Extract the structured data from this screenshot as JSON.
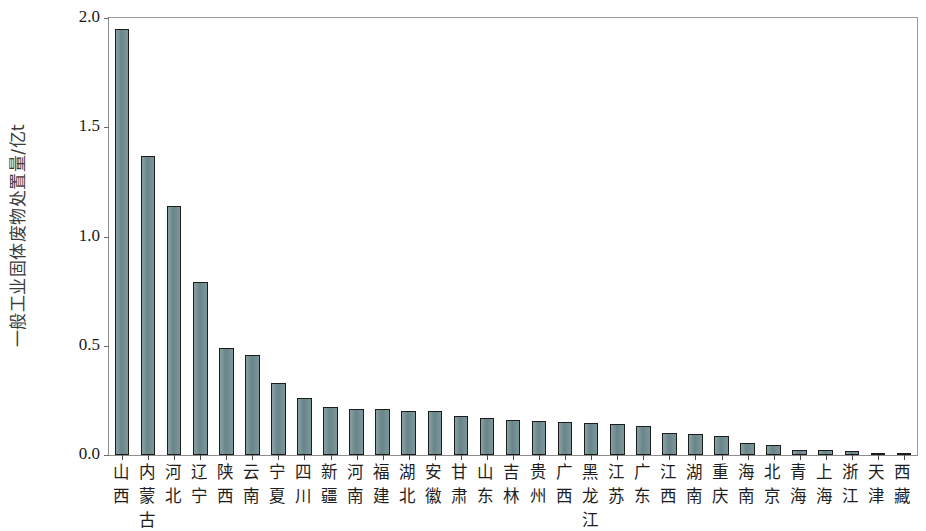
{
  "chart_data": {
    "type": "bar",
    "title": "",
    "xlabel": "",
    "ylabel": "一般工业固体废物处置量/亿t",
    "ylim": [
      0.0,
      2.0
    ],
    "ytick_labels": [
      "0.0",
      "0.5",
      "1.0",
      "1.5",
      "2.0"
    ],
    "ytick_values": [
      0.0,
      0.5,
      1.0,
      1.5,
      2.0
    ],
    "grid": false,
    "legend": null,
    "bar_color": "#6e8c90",
    "bar_edge_color": "#1c1c1c",
    "categories": [
      "山西",
      "内蒙古",
      "河北",
      "辽宁",
      "陕西",
      "云南",
      "宁夏",
      "四川",
      "新疆",
      "河南",
      "福建",
      "湖北",
      "安徽",
      "甘肃",
      "山东",
      "吉林",
      "贵州",
      "广西",
      "黑龙江",
      "江苏",
      "广东",
      "江西",
      "湖南",
      "重庆",
      "海南",
      "北京",
      "青海",
      "上海",
      "浙江",
      "天津",
      "西藏"
    ],
    "values": [
      1.95,
      1.37,
      1.14,
      0.79,
      0.49,
      0.46,
      0.33,
      0.26,
      0.22,
      0.21,
      0.21,
      0.2,
      0.2,
      0.18,
      0.17,
      0.16,
      0.155,
      0.15,
      0.145,
      0.14,
      0.135,
      0.1,
      0.095,
      0.085,
      0.055,
      0.045,
      0.025,
      0.022,
      0.02,
      0.008,
      0.004
    ]
  }
}
